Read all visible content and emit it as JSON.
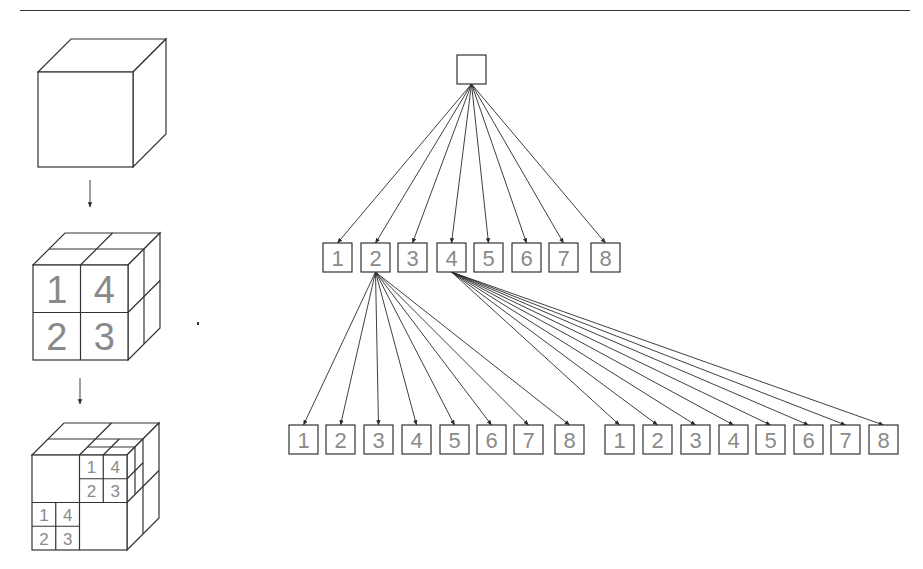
{
  "page": {
    "header_rule": true,
    "stray_mark": {
      "x": 197,
      "y": 322
    }
  },
  "left_panel": {
    "title": "Octree subdivision of a cube",
    "cubes": [
      {
        "id": "cube-level-0",
        "front": {
          "x": 38,
          "y": 72,
          "size": 95
        },
        "depth": 33,
        "subdivision": 0,
        "labels": []
      },
      {
        "id": "cube-level-1",
        "front": {
          "x": 33,
          "y": 265,
          "size": 95
        },
        "depth": 32,
        "subdivision": 1,
        "labels": [
          {
            "text": "1",
            "cell": [
              0,
              0
            ]
          },
          {
            "text": "4",
            "cell": [
              1,
              0
            ]
          },
          {
            "text": "2",
            "cell": [
              0,
              1
            ]
          },
          {
            "text": "3",
            "cell": [
              1,
              1
            ]
          }
        ]
      },
      {
        "id": "cube-level-2",
        "front": {
          "x": 32,
          "y": 455,
          "size": 95
        },
        "depth": 32,
        "subdivision": 2,
        "labels": [
          {
            "text": "1",
            "cell": [
              2,
              0
            ]
          },
          {
            "text": "4",
            "cell": [
              3,
              0
            ]
          },
          {
            "text": "2",
            "cell": [
              2,
              1
            ]
          },
          {
            "text": "3",
            "cell": [
              3,
              1
            ]
          },
          {
            "text": "1",
            "cell": [
              0,
              2
            ]
          },
          {
            "text": "4",
            "cell": [
              1,
              2
            ]
          },
          {
            "text": "2",
            "cell": [
              0,
              3
            ]
          },
          {
            "text": "3",
            "cell": [
              1,
              3
            ]
          }
        ]
      }
    ],
    "arrows": [
      {
        "x": 90,
        "y1": 180,
        "y2": 207
      },
      {
        "x": 80,
        "y1": 378,
        "y2": 404
      }
    ]
  },
  "tree": {
    "box_size": 29,
    "root": {
      "x": 457,
      "y": 55,
      "label": ""
    },
    "level1": {
      "y": 243,
      "nodes": [
        {
          "label": "1",
          "x": 323
        },
        {
          "label": "2",
          "x": 361
        },
        {
          "label": "3",
          "x": 398
        },
        {
          "label": "4",
          "x": 437
        },
        {
          "label": "5",
          "x": 474
        },
        {
          "label": "6",
          "x": 512
        },
        {
          "label": "7",
          "x": 549
        },
        {
          "label": "8",
          "x": 591
        }
      ]
    },
    "level2": [
      {
        "parent_label": "2",
        "parent_index": 1,
        "y": 425,
        "nodes": [
          {
            "label": "1",
            "x": 289
          },
          {
            "label": "2",
            "x": 326
          },
          {
            "label": "3",
            "x": 364
          },
          {
            "label": "4",
            "x": 402
          },
          {
            "label": "5",
            "x": 440
          },
          {
            "label": "6",
            "x": 477
          },
          {
            "label": "7",
            "x": 514
          },
          {
            "label": "8",
            "x": 555
          }
        ]
      },
      {
        "parent_label": "4",
        "parent_index": 3,
        "y": 425,
        "nodes": [
          {
            "label": "1",
            "x": 605
          },
          {
            "label": "2",
            "x": 643
          },
          {
            "label": "3",
            "x": 681
          },
          {
            "label": "4",
            "x": 719
          },
          {
            "label": "5",
            "x": 756
          },
          {
            "label": "6",
            "x": 794
          },
          {
            "label": "7",
            "x": 831
          },
          {
            "label": "8",
            "x": 869
          }
        ]
      }
    ]
  },
  "colors": {
    "line": "#333333",
    "label": "#8a8a8a",
    "background": "#ffffff"
  }
}
